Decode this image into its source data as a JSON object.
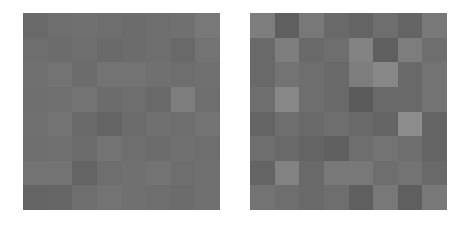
{
  "panels": [
    {
      "id": "left",
      "rows": 8,
      "cols": 8,
      "gray": [
        [
          105,
          110,
          112,
          110,
          108,
          110,
          112,
          120
        ],
        [
          110,
          108,
          110,
          106,
          108,
          110,
          105,
          115
        ],
        [
          112,
          115,
          108,
          115,
          115,
          112,
          110,
          112
        ],
        [
          110,
          112,
          115,
          108,
          110,
          105,
          125,
          110
        ],
        [
          112,
          115,
          105,
          100,
          108,
          112,
          110,
          115
        ],
        [
          110,
          112,
          108,
          115,
          110,
          108,
          112,
          110
        ],
        [
          115,
          115,
          100,
          110,
          112,
          115,
          110,
          112
        ],
        [
          100,
          102,
          110,
          115,
          112,
          110,
          108,
          112
        ]
      ]
    },
    {
      "id": "right",
      "rows": 8,
      "cols": 8,
      "gray": [
        [
          125,
          95,
          120,
          105,
          100,
          110,
          100,
          120
        ],
        [
          105,
          125,
          105,
          110,
          130,
          95,
          125,
          110
        ],
        [
          105,
          115,
          110,
          105,
          125,
          135,
          105,
          115
        ],
        [
          110,
          135,
          110,
          105,
          90,
          105,
          105,
          115
        ],
        [
          100,
          110,
          105,
          110,
          105,
          100,
          140,
          100
        ],
        [
          110,
          105,
          100,
          95,
          110,
          115,
          110,
          100
        ],
        [
          100,
          130,
          105,
          120,
          120,
          110,
          115,
          105
        ],
        [
          115,
          110,
          105,
          110,
          95,
          120,
          95,
          120
        ]
      ]
    }
  ],
  "background": "#ffffff"
}
